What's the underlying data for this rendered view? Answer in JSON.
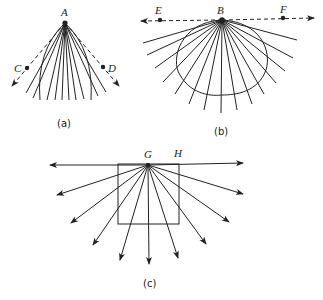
{
  "figure": {
    "panels": [
      {
        "id": "a",
        "caption": "(a)",
        "source_point": "A",
        "points": [
          "C",
          "D"
        ],
        "reference_line": "dashed double-arrow line through C and D (bent at A)",
        "ray_count": 10,
        "boundary": "lens/convex curve below A"
      },
      {
        "id": "b",
        "caption": "(b)",
        "source_point": "B",
        "points": [
          "E",
          "F"
        ],
        "reference_line": "dashed horizontal double-arrow line through E, B, F",
        "ray_count": 15,
        "boundary": "circular/elliptic curve hanging below B"
      },
      {
        "id": "c",
        "caption": "(c)",
        "source_point": "G",
        "points": [
          "H"
        ],
        "reference_line": "solid horizontal double-arrow line through G",
        "ray_count": 9,
        "boundary": "square below the line, G at top edge center"
      }
    ],
    "colors": {
      "ink": "#222222",
      "background": "#ffffff"
    }
  }
}
